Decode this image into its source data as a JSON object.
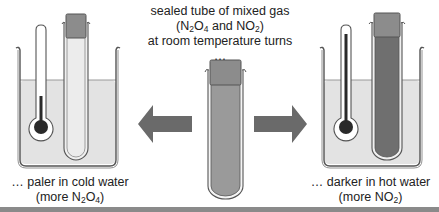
{
  "diagram": {
    "title_caption": {
      "line1": "sealed tube of mixed gas",
      "line2_prefix": "(N",
      "line2_sub1": "2",
      "line2_mid1": "O",
      "line2_sub2": "4",
      "line2_mid2": " and NO",
      "line2_sub3": "2",
      "line2_suffix": ")",
      "line3": "at room temperature turns …"
    },
    "left_caption": {
      "line1": "… paler in cold water",
      "line2_prefix": "(more N",
      "line2_sub1": "2",
      "line2_mid": "O",
      "line2_sub2": "4",
      "line2_suffix": ")"
    },
    "right_caption": {
      "line1": "… darker in hot water",
      "line2_prefix": "(more NO",
      "line2_sub1": "2",
      "line2_suffix": ")"
    },
    "colors": {
      "water": "#e3e3e3",
      "beaker_outline": "#555555",
      "tube_pale_gas": "#ececec",
      "tube_room_gas": "#9a9a9a",
      "tube_dark_gas": "#6f6f6f",
      "stopper": "#8c8c8c",
      "arrow": "#6a6a6a",
      "thermometer_liquid": "#2a2a2a",
      "bottom_bar": "#8a8a8a"
    },
    "elements": {
      "left_beaker": "cold water beaker with thermometer (low reading) and pale gas tube",
      "center_tube": "sealed tube at room temperature",
      "right_beaker": "hot water beaker with thermometer (high reading) and dark gas tube",
      "left_arrow": "arrow pointing left",
      "right_arrow": "arrow pointing right"
    }
  }
}
